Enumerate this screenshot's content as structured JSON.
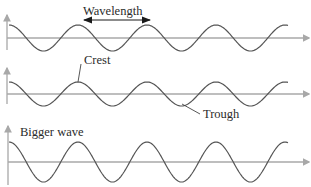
{
  "diagram": {
    "panels": [
      {
        "id": "wave-1",
        "axis_y": 38,
        "amplitude": 13,
        "period": 69,
        "label": "Wavelength"
      },
      {
        "id": "wave-2",
        "axis_y": 94,
        "amplitude": 12,
        "period": 69,
        "labels": [
          "Crest",
          "Trough"
        ]
      },
      {
        "id": "wave-3",
        "axis_y": 162,
        "amplitude": 20,
        "period": 69,
        "label": "Bigger wave"
      }
    ]
  },
  "labels": {
    "wavelength": "Wavelength",
    "crest": "Crest",
    "trough": "Trough",
    "bigger_wave": "Bigger wave"
  },
  "colors": {
    "axis": "#a8a8a8",
    "wave": "#555555",
    "text": "#2b2b2b"
  }
}
